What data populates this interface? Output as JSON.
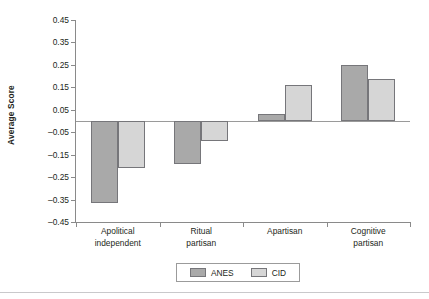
{
  "chart_data": {
    "type": "bar",
    "title": "",
    "subtitle": "",
    "xlabel": "",
    "ylabel": "Average Score",
    "categories": [
      "Apolitical independent",
      "Ritual partisan",
      "Apartisan",
      "Cognitive partisan"
    ],
    "category_lines": [
      [
        "Apolitical",
        "independent"
      ],
      [
        "Ritual",
        "partisan"
      ],
      [
        "Apartisan",
        ""
      ],
      [
        "Cognitive",
        "partisan"
      ]
    ],
    "series": [
      {
        "name": "ANES",
        "color": "#a9a9a9",
        "values": [
          -0.365,
          -0.19,
          0.03,
          0.25
        ]
      },
      {
        "name": "CID",
        "color": "#d6d6d6",
        "values": [
          -0.21,
          -0.09,
          0.16,
          0.185
        ]
      }
    ],
    "ylim": [
      -0.45,
      0.45
    ],
    "yticks": [
      0.45,
      0.35,
      0.25,
      0.15,
      0.05,
      -0.05,
      -0.15,
      -0.25,
      -0.35,
      -0.45
    ],
    "ytick_labels": [
      "0.45",
      "0.35",
      "0.25",
      "0.15",
      "0.05",
      "–0.05",
      "–0.15",
      "–0.25",
      "–0.35",
      "–0.45"
    ],
    "grid": false,
    "zero_line": 0,
    "legend_position": "bottom-center",
    "legend_entries": [
      "ANES",
      "CID"
    ],
    "bar_border_color": "#76767a",
    "axis_color": "#8a8a8a"
  }
}
